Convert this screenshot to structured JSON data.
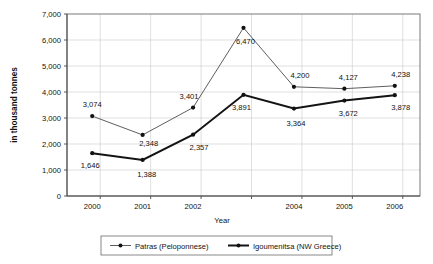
{
  "chart_data": {
    "type": "line",
    "title": "",
    "subtitle": "",
    "xlabel": "Year",
    "ylabel": "in thousand tonnes",
    "categories": [
      "2000",
      "2001",
      "2002",
      "2003",
      "2004",
      "2005",
      "2006"
    ],
    "x_tick_labels": [
      "2000",
      "2001",
      "2002",
      "",
      "2004",
      "2005",
      "2006"
    ],
    "y_tick_labels": [
      "0",
      "1,000",
      "2,000",
      "3,000",
      "4,000",
      "5,000",
      "6,000",
      "7,000"
    ],
    "y_tick_values": [
      0,
      1000,
      2000,
      3000,
      4000,
      5000,
      6000,
      7000
    ],
    "ylim": [
      0,
      7000
    ],
    "grid": true,
    "legend_position": "bottom",
    "series": [
      {
        "name": "Patras (Peloponnese)",
        "values": [
          3074,
          2348,
          3401,
          6470,
          4200,
          4127,
          4238
        ],
        "labels": [
          "3,074",
          "2,348",
          "3,401",
          "6,470",
          "4,200",
          "4,127",
          "4,238"
        ],
        "line_style": "thin",
        "color": "#555555"
      },
      {
        "name": "Igoumenitsa (NW Greece)",
        "values": [
          1646,
          1388,
          2357,
          3891,
          3364,
          3672,
          3878
        ],
        "labels": [
          "1,646",
          "1,388",
          "2,357",
          "3,891",
          "3,364",
          "3,672",
          "3,878"
        ],
        "line_style": "thick",
        "color": "#141414"
      }
    ]
  },
  "legend": {
    "entries": [
      {
        "label": "Patras (Peloponnese)"
      },
      {
        "label": "Igoumenitsa (NW Greece)"
      }
    ]
  }
}
